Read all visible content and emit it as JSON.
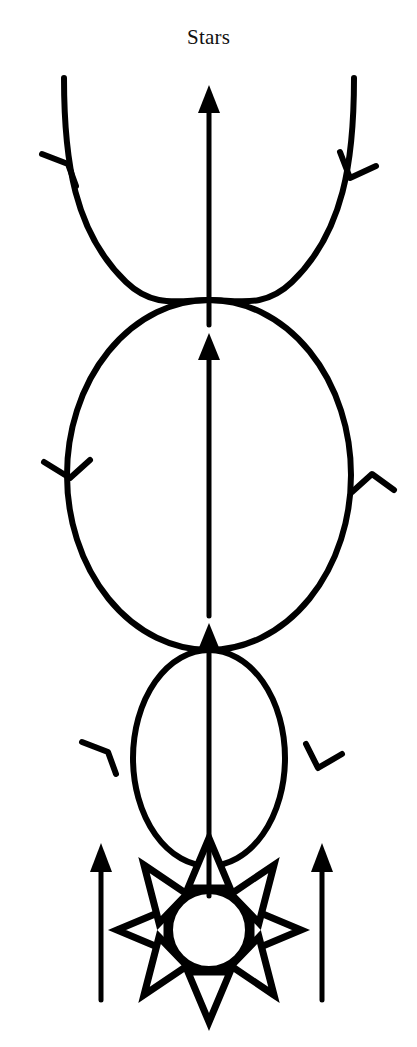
{
  "figure": {
    "title": "Stars",
    "background_color": "#ffffff",
    "ink_color": "#000000",
    "width": 417,
    "height": 1047
  },
  "elements": {
    "title_label": "Stars",
    "sun_symbol": {
      "name": "sun-symbol",
      "circle_center_x": 209,
      "circle_center_y": 930,
      "circle_radius": 40,
      "ray_count": 8,
      "ray_style": "hollow-triangle"
    },
    "inner_orbit": {
      "name": "inner-orbit-circle",
      "center_x": 209,
      "center_y": 758,
      "radius_x": 76,
      "radius_y": 108,
      "direction_markers": [
        "up-left-side",
        "down-right-side"
      ]
    },
    "outer_orbit": {
      "name": "outer-orbit-circle",
      "center_x": 209,
      "center_y": 475,
      "radius_x": 142,
      "radius_y": 175,
      "direction_markers": [
        "down-left-side",
        "up-right-side"
      ]
    },
    "flare_left": {
      "name": "flare-curve-left",
      "direction_marker": "up"
    },
    "flare_right": {
      "name": "flare-curve-right",
      "direction_marker": "down"
    },
    "central_arrow": {
      "name": "central-vertical-arrow",
      "x": 209,
      "tip_y": 85,
      "tail_y": 895,
      "intermediate_arrowheads_y": [
        345,
        635
      ]
    },
    "side_arrow_left": {
      "name": "side-arrow-left",
      "x": 101,
      "tip_y": 843,
      "tail_y": 1000
    },
    "side_arrow_right": {
      "name": "side-arrow-right",
      "x": 322,
      "tip_y": 843,
      "tail_y": 1000
    }
  }
}
